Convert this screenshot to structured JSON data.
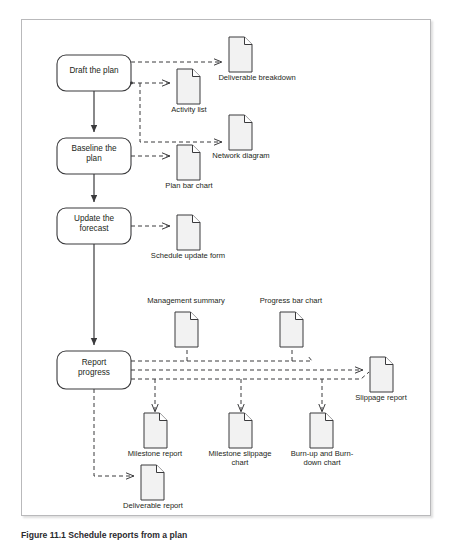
{
  "figure": {
    "caption": "Figure 11.1 Schedule reports from a plan",
    "background_color": "#ffffff",
    "frame_border_color": "#b9b9bb",
    "stroke_color": "#3a3a3c",
    "doc_fill_color": "#f2f2f2",
    "text_color": "#231f20"
  },
  "process_steps": [
    {
      "id": "draft-the-plan",
      "label": "Draft the plan",
      "x": 56,
      "y": 54,
      "w": 74,
      "h": 36
    },
    {
      "id": "baseline-the-plan",
      "label": "Baseline the\nplan",
      "x": 56,
      "y": 137,
      "w": 74,
      "h": 36
    },
    {
      "id": "update-the-forecast",
      "label": "Update the\nforecast",
      "x": 56,
      "y": 207,
      "w": 74,
      "h": 36
    },
    {
      "id": "report-progress",
      "label": "Report\nprogress",
      "x": 56,
      "y": 350,
      "w": 74,
      "h": 38
    }
  ],
  "documents": [
    {
      "id": "deliverable-breakdown",
      "label": "Deliverable breakdown",
      "x": 228,
      "y": 36,
      "label_x": 178,
      "label_y": 72,
      "label_w": 140
    },
    {
      "id": "activity-list",
      "label": "Activity list",
      "x": 176,
      "y": 68,
      "label_x": 136,
      "label_y": 104,
      "label_w": 80
    },
    {
      "id": "network-diagram",
      "label": "Network diagram",
      "x": 228,
      "y": 114,
      "label_x": 186,
      "label_y": 150,
      "label_w": 118
    },
    {
      "id": "plan-bar-chart",
      "label": "Plan bar chart",
      "x": 176,
      "y": 144,
      "label_x": 134,
      "label_y": 180,
      "label_w": 86
    },
    {
      "id": "schedule-update-form",
      "label": "Schedule update form",
      "x": 176,
      "y": 214,
      "label_x": 128,
      "label_y": 250,
      "label_w": 130
    },
    {
      "id": "management-summary",
      "label": "Management summary",
      "x": 181,
      "y": 311,
      "label_x": 140,
      "label_y": 293,
      "label_w": 124
    },
    {
      "id": "progress-bar-chart",
      "label": "Progress bar chart",
      "x": 287,
      "y": 311,
      "label_x": 247,
      "label_y": 293,
      "label_w": 110
    },
    {
      "id": "slippage-report",
      "label": "Slippage report",
      "x": 367,
      "y": 356,
      "label_x": 333,
      "label_y": 393,
      "label_w": 90
    },
    {
      "id": "milestone-report",
      "label": "Milestone report",
      "x": 147,
      "y": 412,
      "label_x": 107,
      "label_y": 448,
      "label_w": 96
    },
    {
      "id": "milestone-slippage-chart",
      "label": "Milestone slippage\nchart",
      "x": 232,
      "y": 412,
      "label_x": 192,
      "label_y": 448,
      "label_w": 100
    },
    {
      "id": "burn-up-burn-down-chart",
      "label": "Burn-up and Burn-\ndown chart",
      "x": 313,
      "y": 412,
      "label_x": 275,
      "label_y": 448,
      "label_w": 100
    },
    {
      "id": "deliverable-report",
      "label": "Deliverable report",
      "x": 140,
      "y": 464,
      "label_x": 104,
      "label_y": 500,
      "label_w": 104
    }
  ],
  "connectors": {
    "solid_flow": [
      {
        "from": "draft-the-plan",
        "to": "baseline-the-plan"
      },
      {
        "from": "baseline-the-plan",
        "to": "update-the-forecast"
      },
      {
        "from": "update-the-forecast",
        "to": "report-progress"
      }
    ],
    "dashed_outputs": [
      {
        "from": "draft-the-plan",
        "to": "deliverable-breakdown"
      },
      {
        "from": "draft-the-plan",
        "to": "activity-list"
      },
      {
        "from": "draft-the-plan",
        "to": "network-diagram"
      },
      {
        "from": "baseline-the-plan",
        "to": "plan-bar-chart"
      },
      {
        "from": "update-the-forecast",
        "to": "schedule-update-form"
      },
      {
        "from": "report-progress",
        "to": "management-summary"
      },
      {
        "from": "report-progress",
        "to": "progress-bar-chart"
      },
      {
        "from": "report-progress",
        "to": "slippage-report"
      },
      {
        "from": "report-progress",
        "to": "milestone-report"
      },
      {
        "from": "report-progress",
        "to": "milestone-slippage-chart"
      },
      {
        "from": "report-progress",
        "to": "burn-up-burn-down-chart"
      },
      {
        "from": "report-progress",
        "to": "deliverable-report"
      }
    ]
  }
}
